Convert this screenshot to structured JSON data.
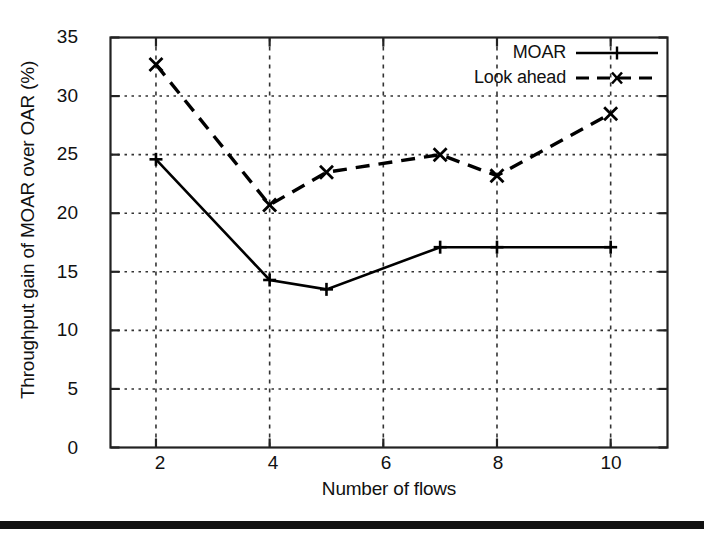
{
  "chart_data": {
    "type": "line",
    "title": "",
    "xlabel": "Number of flows",
    "ylabel": "Throughput gain of MOAR over OAR (%)",
    "xlim": [
      1.2,
      11.0
    ],
    "ylim": [
      0,
      35
    ],
    "xticks": [
      2,
      4,
      6,
      8,
      10
    ],
    "yticks": [
      0,
      5,
      10,
      15,
      20,
      25,
      30,
      35
    ],
    "grid": true,
    "legend_position": "top-right",
    "series": [
      {
        "name": "MOAR",
        "style": "solid",
        "marker": "plus",
        "color": "#000000",
        "x": [
          2,
          4,
          5,
          7,
          8,
          10
        ],
        "values": [
          24.6,
          14.3,
          13.5,
          17.1,
          17.1,
          17.1
        ]
      },
      {
        "name": "Look ahead",
        "style": "dashed",
        "marker": "x",
        "color": "#000000",
        "x": [
          2,
          4,
          5,
          7,
          8,
          10
        ],
        "values": [
          32.7,
          20.7,
          23.5,
          25.0,
          23.2,
          28.5
        ]
      }
    ]
  },
  "axes": {
    "y_title": "Throughput gain of MOAR over OAR (%)",
    "x_title": "Number of flows",
    "ytick_labels": [
      "0",
      "5",
      "10",
      "15",
      "20",
      "25",
      "30",
      "35"
    ],
    "xtick_labels": [
      "2",
      "4",
      "6",
      "8",
      "10"
    ]
  },
  "legend": {
    "entries": [
      {
        "label": "MOAR"
      },
      {
        "label": "Look ahead"
      }
    ]
  },
  "colors": {
    "ink": "#000000",
    "background": "#ffffff",
    "grid": "#333333",
    "scan_bar": "#111111"
  }
}
